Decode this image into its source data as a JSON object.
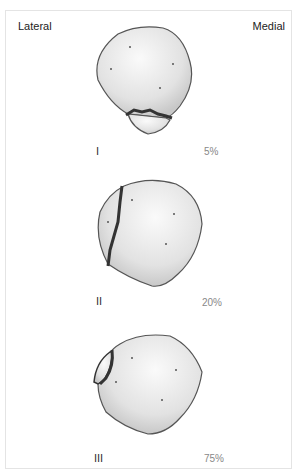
{
  "labels": {
    "left": "Lateral",
    "right": "Medial"
  },
  "panels": [
    {
      "grade": "I",
      "percent": "5%"
    },
    {
      "grade": "II",
      "percent": "20%"
    },
    {
      "grade": "III",
      "percent": "75%"
    }
  ],
  "colors": {
    "bone_fill": "#e8e8e8",
    "bone_outline": "#555555",
    "fracture": "#333333",
    "frame": "#e4e4e4"
  }
}
